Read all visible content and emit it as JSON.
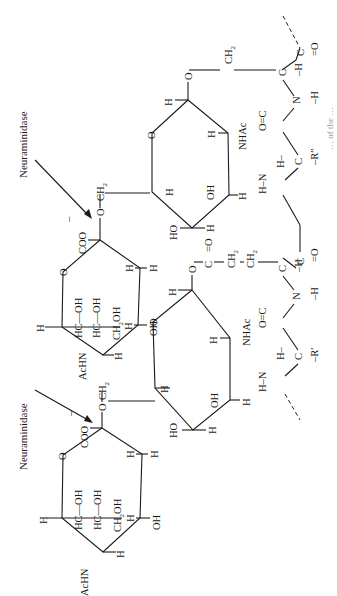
{
  "figure": {
    "orientation": "rotated 90 degrees counter-clockwise",
    "enzyme_labels": [
      "Neuraminidase",
      "Neuraminidase"
    ],
    "sialic_acid_upper": {
      "carboxylate": "COO⁻",
      "glycosidic_oxygen": "O",
      "linker": "CH₂",
      "ring_oxygen": "O",
      "substituents": [
        "H",
        "H",
        "OH",
        "H",
        "H",
        "AcHN"
      ],
      "side_chain": [
        "HC—OH",
        "HC—OH",
        "CH₂OH"
      ]
    },
    "sialic_acid_lower": {
      "carboxylate": "COO⁻",
      "glycosidic_oxygen": "O",
      "linker": "CH₂",
      "ring_oxygen": "O",
      "substituents": [
        "H",
        "H",
        "OH",
        "H",
        "H",
        "AcHN"
      ],
      "side_chain": [
        "HC—OH",
        "HC—OH",
        "CH₂OH"
      ]
    },
    "galnac_upper": {
      "ring_oxygen": "O",
      "substituents": [
        "H",
        "NHAc",
        "H",
        "OH",
        "H",
        "HO",
        "H",
        "H"
      ],
      "linker_to_peptide": [
        "O",
        "CH₂"
      ]
    },
    "galnac_lower": {
      "ring_oxygen": "O",
      "substituents": [
        "H",
        "NHAc",
        "H",
        "OH",
        "H",
        "HO",
        "H"
      ],
      "ester_linker": [
        "O",
        "C=O",
        "CH₂",
        "CH₂"
      ]
    },
    "peptide_backbone": {
      "groups": [
        "C=O",
        "C—H",
        "N—H",
        "O=C",
        "H—C—R″",
        "H—N",
        "C=O",
        "C—H",
        "N—H",
        "O=C",
        "H—C—R′",
        "H—N"
      ],
      "side_chain_labels": [
        "R″",
        "R′"
      ]
    },
    "caption_fragment": "… of the …"
  }
}
